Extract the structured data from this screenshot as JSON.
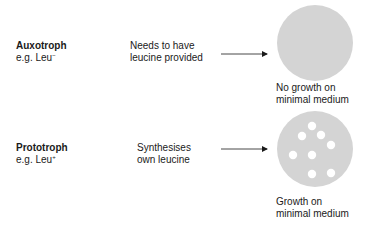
{
  "rows": [
    {
      "type_label": "Auxotroph",
      "example_prefix": "e.g. Leu",
      "example_sup": "−",
      "description_lines": [
        "Needs to have",
        "leucine provided"
      ],
      "outcome_lines": [
        "No growth on",
        "minimal medium"
      ],
      "colonies": 0
    },
    {
      "type_label": "Prototroph",
      "example_prefix": "e.g. Leu",
      "example_sup": "+",
      "description_lines": [
        "Synthesises",
        "own leucine"
      ],
      "outcome_lines": [
        "Growth on",
        "minimal medium"
      ],
      "colonies": 8
    }
  ],
  "colors": {
    "plate_fill": "#d4d4d4",
    "colony_fill": "#ffffff",
    "arrow": "#1a1a1a"
  }
}
